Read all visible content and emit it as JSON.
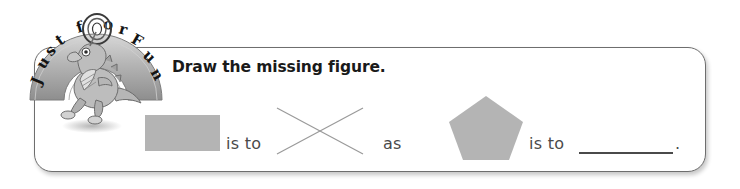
{
  "logo": {
    "name": "just-for-fun-badge",
    "arch_text": "Just for Fun",
    "arch_letters": [
      "J",
      "u",
      "s",
      "t",
      "f",
      "o",
      "r",
      "F",
      "u",
      "n"
    ],
    "mascot": "dinosaur-mascot",
    "arch_color": "#b9b9b9",
    "letter_color": "#141414"
  },
  "panel": {
    "heading": "Draw the missing figure.",
    "border_color": "#6e6e6e"
  },
  "analogy": {
    "shape_color": "#b4b4b4",
    "text_color": "#4a4a4a",
    "terms": [
      {
        "kind": "shape",
        "name": "rectangle",
        "label": "rectangle"
      },
      {
        "kind": "text",
        "name": "is-to",
        "label": "is to"
      },
      {
        "kind": "shape",
        "name": "x-mark",
        "label": "X"
      },
      {
        "kind": "text",
        "name": "as",
        "label": "as"
      },
      {
        "kind": "shape",
        "name": "pentagon",
        "label": "pentagon"
      },
      {
        "kind": "text",
        "name": "is-to",
        "label": "is to"
      },
      {
        "kind": "blank",
        "name": "answer-blank",
        "label": ""
      }
    ],
    "is_to_1": "is to",
    "as": "as",
    "is_to_2": "is to",
    "period": "."
  }
}
